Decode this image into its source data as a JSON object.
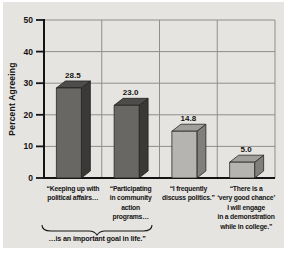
{
  "colors": {
    "page": "#ffffff",
    "panel": "#e6e4e0",
    "grid": "#8f8e8c",
    "axis": "#141414",
    "text": "#141414"
  },
  "chart_data": {
    "type": "bar",
    "title": "",
    "ylabel": "Percent Agreeing",
    "xlabel": "",
    "ylim": [
      0,
      50
    ],
    "yticks": [
      0,
      10,
      20,
      30,
      40,
      50
    ],
    "grid": true,
    "legend": false,
    "categories": [
      "“Keeping up with political affairs…",
      "“Participating in community action programs…",
      "“I frequently discuss politics.”",
      "“There is a ‘very good chance’ I will engage in a demonstration while in college.”"
    ],
    "category_lines": [
      [
        "“Keeping up with",
        "political affairs…"
      ],
      [
        "“Participating",
        "in community",
        "action",
        "programs…"
      ],
      [
        "“I frequently",
        "discuss politics.”"
      ],
      [
        "“There is a",
        "‘very good chance’",
        "I will engage",
        "in a demonstration",
        "while in college.”"
      ]
    ],
    "values": [
      28.5,
      23.0,
      14.8,
      5.0
    ],
    "value_labels": [
      "28.5",
      "23.0",
      "14.8",
      "5.0"
    ],
    "bar_styles": [
      {
        "front": "#686764",
        "top": "#4d4c4a",
        "side": "#3a3938"
      },
      {
        "front": "#686764",
        "top": "#4d4c4a",
        "side": "#3a3938"
      },
      {
        "front": "#b6b4b1",
        "top": "#a19f9c",
        "side": "#817f7c"
      },
      {
        "front": "#b6b4b1",
        "top": "#a19f9c",
        "side": "#817f7c"
      }
    ],
    "annotation": {
      "label": "…is an important goal in life.”",
      "applies_to": "first two bars"
    }
  }
}
